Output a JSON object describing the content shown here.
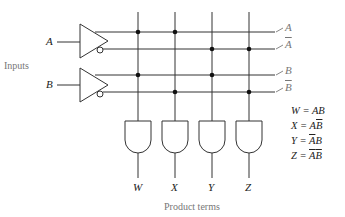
{
  "diagram": {
    "inputs_label": "Inputs",
    "inputs": [
      "A",
      "B"
    ],
    "lines": [
      {
        "name": "A",
        "complement": false
      },
      {
        "name": "A",
        "complement": true
      },
      {
        "name": "B",
        "complement": false
      },
      {
        "name": "B",
        "complement": true
      }
    ],
    "outputs": [
      "W",
      "X",
      "Y",
      "Z"
    ],
    "outputs_label": "Product terms",
    "equations": [
      {
        "lhs": "W",
        "terms": [
          {
            "v": "A",
            "bar": false
          },
          {
            "v": "B",
            "bar": false
          }
        ]
      },
      {
        "lhs": "X",
        "terms": [
          {
            "v": "A",
            "bar": false
          },
          {
            "v": "B",
            "bar": true
          }
        ]
      },
      {
        "lhs": "Y",
        "terms": [
          {
            "v": "A",
            "bar": true
          },
          {
            "v": "B",
            "bar": false
          }
        ]
      },
      {
        "lhs": "Z",
        "terms": [
          {
            "v": "A",
            "bar": true
          },
          {
            "v": "B",
            "bar": true
          }
        ]
      }
    ],
    "equation_text": [
      "W = AB",
      "X = AB̄",
      "Y = ĀB",
      "Z = ĀB̄"
    ]
  }
}
